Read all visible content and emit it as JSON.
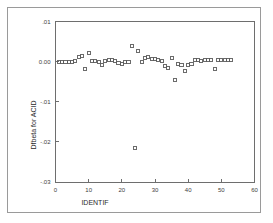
{
  "figure": {
    "background_color": "#ffffff",
    "frame_color": "#9a9a9a",
    "axis_color": "#6e6e6e",
    "marker_color": "#5b5b5b"
  },
  "chart_data": {
    "type": "scatter",
    "title": "",
    "subtitle": "",
    "xlabel": "IDENTIF",
    "ylabel": "Dfbeta for ACID",
    "xlim": [
      0,
      60
    ],
    "ylim": [
      -0.03,
      0.01
    ],
    "grid": false,
    "legend": null,
    "xticks": [
      0,
      10,
      20,
      30,
      40,
      50,
      60
    ],
    "xtick_labels": [
      "0",
      "10",
      "20",
      "30",
      "40",
      "50",
      "60"
    ],
    "yticks": [
      0.01,
      0.0,
      -0.01,
      -0.02,
      -0.03
    ],
    "ytick_labels": [
      ".01",
      "0.00",
      "-.01",
      "-.02",
      "-.03"
    ],
    "marker_shape": "open-square",
    "series": [
      {
        "name": "Dfbeta for ACID",
        "x": [
          1,
          2,
          3,
          4,
          5,
          6,
          7,
          8,
          9,
          10,
          11,
          12,
          13,
          14,
          15,
          16,
          17,
          18,
          19,
          20,
          21,
          22,
          23,
          24,
          25,
          26,
          27,
          28,
          29,
          30,
          31,
          32,
          33,
          34,
          35,
          36,
          37,
          38,
          39,
          40,
          41,
          42,
          43,
          44,
          45,
          46,
          47,
          48,
          49,
          50,
          51,
          52,
          53
        ],
        "y": [
          -0.0001,
          -0.0001,
          -0.0001,
          0.0,
          0.0,
          0.0002,
          0.0011,
          0.0013,
          -0.0018,
          0.0021,
          0.0002,
          0.0001,
          0.0,
          -0.0008,
          0.0001,
          0.0004,
          0.0004,
          0.0002,
          -0.0004,
          -0.0005,
          0.0,
          0.0,
          0.004,
          -0.0215,
          0.0027,
          -0.0002,
          0.0008,
          0.0011,
          0.0007,
          0.0006,
          0.0005,
          0.0001,
          -0.0011,
          -0.0016,
          0.0008,
          -0.0045,
          -0.0005,
          -0.0009,
          -0.0024,
          -0.0008,
          -0.0006,
          0.0003,
          0.0004,
          0.0002,
          0.0004,
          0.0005,
          0.0003,
          -0.0018,
          0.0004,
          0.0003,
          0.0005,
          0.0004,
          0.0005
        ]
      }
    ]
  }
}
